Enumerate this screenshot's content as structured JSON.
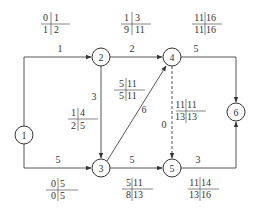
{
  "diagram": {
    "type": "activity-network",
    "nodes": [
      {
        "id": "1",
        "label": "1"
      },
      {
        "id": "2",
        "label": "2"
      },
      {
        "id": "3",
        "label": "3"
      },
      {
        "id": "4",
        "label": "4"
      },
      {
        "id": "5",
        "label": "5"
      },
      {
        "id": "6",
        "label": "6"
      }
    ],
    "edges": [
      {
        "from": "1",
        "to": "2",
        "duration": "1",
        "grid": {
          "tl": "0",
          "tr": "1",
          "bl": "1",
          "br": "2"
        }
      },
      {
        "from": "1",
        "to": "3",
        "duration": "5",
        "grid": {
          "tl": "0",
          "tr": "5",
          "bl": "0",
          "br": "5"
        }
      },
      {
        "from": "2",
        "to": "3",
        "duration": "3",
        "grid": {
          "tl": "1",
          "tr": "4",
          "bl": "2",
          "br": "5"
        }
      },
      {
        "from": "2",
        "to": "4",
        "duration": "2",
        "grid": {
          "tl": "1",
          "tr": "3",
          "bl": "9",
          "br": "11"
        }
      },
      {
        "from": "3",
        "to": "4",
        "duration": "6",
        "grid": {
          "tl": "5",
          "tr": "11",
          "bl": "5",
          "br": "11"
        }
      },
      {
        "from": "3",
        "to": "5",
        "duration": "5",
        "grid": {
          "tl": "5",
          "tr": "11",
          "bl": "8",
          "br": "13"
        }
      },
      {
        "from": "4",
        "to": "5",
        "duration": "0",
        "dummy": true,
        "grid": {
          "tl": "11",
          "tr": "11",
          "bl": "13",
          "br": "13"
        }
      },
      {
        "from": "4",
        "to": "6",
        "duration": "5",
        "grid": {
          "tl": "11",
          "tr": "16",
          "bl": "11",
          "br": "16"
        }
      },
      {
        "from": "5",
        "to": "6",
        "duration": "3",
        "grid": {
          "tl": "11",
          "tr": "14",
          "bl": "13",
          "br": "16"
        }
      }
    ]
  }
}
